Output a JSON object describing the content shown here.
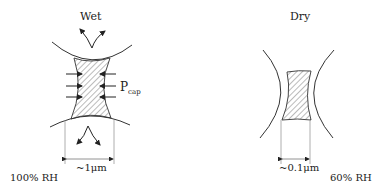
{
  "panels": {
    "wet": {
      "title": "Wet",
      "rh": "100% RH",
      "gap": "~1μm",
      "pressure_label": "P",
      "pressure_sub": "cap"
    },
    "dry": {
      "title": "Dry",
      "rh": "60% RH",
      "gap": "~0.1μm"
    }
  },
  "colors": {
    "line": "#333333",
    "hatch": "#555555",
    "dim": "#999999"
  }
}
